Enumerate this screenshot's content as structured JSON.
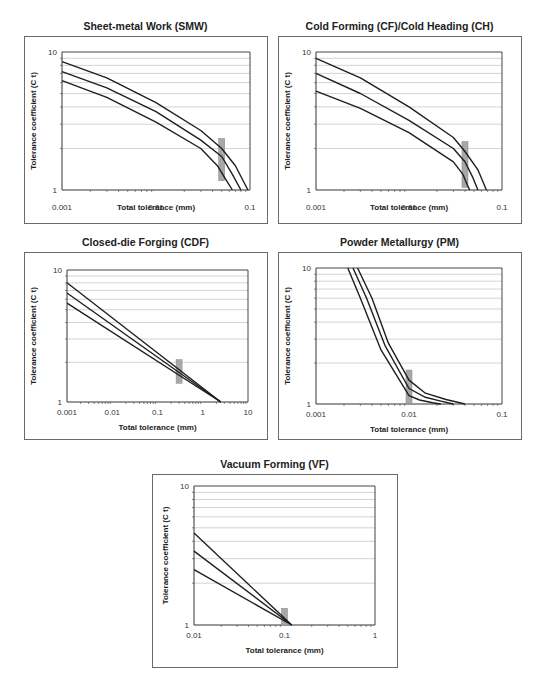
{
  "chart_data": [
    {
      "id": "smw",
      "type": "line",
      "title": "Sheet-metal Work (SMW)",
      "xlabel": "Total tolerance (mm)",
      "ylabel": "Tolerance coefficient (C t)",
      "xscale": "log",
      "yscale": "log",
      "xlim": [
        0.001,
        0.1
      ],
      "ylim": [
        1,
        10
      ],
      "xticks": [
        "0.001",
        "0.01",
        "0.1"
      ],
      "yticks": [
        "1",
        "10"
      ],
      "grid": "horizontal minor gridlines",
      "legend": null,
      "marker_band_x": 0.05,
      "series": [
        {
          "name": "upper",
          "x": [
            0.001,
            0.003,
            0.01,
            0.03,
            0.05,
            0.07,
            0.095
          ],
          "y": [
            8.5,
            6.5,
            4.3,
            2.7,
            2.0,
            1.5,
            1.0
          ]
        },
        {
          "name": "middle",
          "x": [
            0.001,
            0.003,
            0.01,
            0.03,
            0.05,
            0.065,
            0.08
          ],
          "y": [
            7.2,
            5.5,
            3.7,
            2.3,
            1.75,
            1.3,
            1.0
          ]
        },
        {
          "name": "lower",
          "x": [
            0.001,
            0.003,
            0.01,
            0.03,
            0.045,
            0.055,
            0.065
          ],
          "y": [
            6.2,
            4.7,
            3.1,
            2.0,
            1.5,
            1.2,
            1.0
          ]
        }
      ]
    },
    {
      "id": "cfch",
      "type": "line",
      "title": "Cold Forming (CF)/Cold Heading (CH)",
      "xlabel": "Total tolerance (mm)",
      "ylabel": "Tolerance coefficient (C t)",
      "xscale": "log",
      "yscale": "log",
      "xlim": [
        0.001,
        0.1
      ],
      "ylim": [
        1,
        10
      ],
      "xticks": [
        "0.001",
        "0.01",
        "0.1"
      ],
      "yticks": [
        "1",
        "10"
      ],
      "grid": "horizontal minor gridlines",
      "legend": null,
      "marker_band_x": 0.04,
      "series": [
        {
          "name": "upper",
          "x": [
            0.001,
            0.003,
            0.01,
            0.03,
            0.04,
            0.055,
            0.068
          ],
          "y": [
            9.0,
            6.5,
            4.0,
            2.4,
            1.9,
            1.4,
            1.0
          ]
        },
        {
          "name": "middle",
          "x": [
            0.001,
            0.003,
            0.01,
            0.03,
            0.04,
            0.048,
            0.055
          ],
          "y": [
            7.0,
            5.0,
            3.2,
            2.0,
            1.6,
            1.25,
            1.0
          ]
        },
        {
          "name": "lower",
          "x": [
            0.001,
            0.003,
            0.01,
            0.03,
            0.038,
            0.042,
            0.045
          ],
          "y": [
            5.2,
            3.9,
            2.6,
            1.6,
            1.3,
            1.1,
            1.0
          ]
        }
      ]
    },
    {
      "id": "cdf",
      "type": "line",
      "title": "Closed-die Forging (CDF)",
      "xlabel": "Total tolerance (mm)",
      "ylabel": "Tolerance coefficient (C t)",
      "xscale": "log",
      "yscale": "log",
      "xlim": [
        0.001,
        10
      ],
      "ylim": [
        1,
        10
      ],
      "xticks": [
        "0.001",
        "0.01",
        "0.1",
        "1",
        "10"
      ],
      "yticks": [
        "1",
        "10"
      ],
      "grid": "horizontal minor gridlines",
      "legend": null,
      "marker_band_x": 0.3,
      "series": [
        {
          "name": "upper",
          "x": [
            0.001,
            2.5
          ],
          "y": [
            8.0,
            1.0
          ]
        },
        {
          "name": "middle",
          "x": [
            0.001,
            2.5
          ],
          "y": [
            6.7,
            1.0
          ]
        },
        {
          "name": "lower",
          "x": [
            0.001,
            2.5
          ],
          "y": [
            5.6,
            1.0
          ]
        }
      ]
    },
    {
      "id": "pm",
      "type": "line",
      "title": "Powder Metallurgy (PM)",
      "xlabel": "Total tolerance (mm)",
      "ylabel": "Tolerance coefficient (C t)",
      "xscale": "log",
      "yscale": "log",
      "xlim": [
        0.001,
        0.1
      ],
      "ylim": [
        1,
        10
      ],
      "xticks": [
        "0.001",
        "0.01",
        "0.1"
      ],
      "yticks": [
        "1",
        "10"
      ],
      "grid": "horizontal minor gridlines",
      "legend": null,
      "marker_band_x": 0.01,
      "series": [
        {
          "name": "upper",
          "x": [
            0.0028,
            0.004,
            0.006,
            0.01,
            0.015,
            0.025,
            0.04
          ],
          "y": [
            10,
            6.0,
            2.8,
            1.5,
            1.2,
            1.08,
            1.0
          ]
        },
        {
          "name": "middle",
          "x": [
            0.0025,
            0.0035,
            0.0055,
            0.01,
            0.015,
            0.022,
            0.03
          ],
          "y": [
            10,
            6.0,
            2.7,
            1.3,
            1.12,
            1.05,
            1.0
          ]
        },
        {
          "name": "lower",
          "x": [
            0.0022,
            0.003,
            0.005,
            0.01,
            0.013,
            0.018,
            0.022
          ],
          "y": [
            10,
            6.0,
            2.5,
            1.15,
            1.07,
            1.02,
            1.0
          ]
        }
      ]
    },
    {
      "id": "vf",
      "type": "line",
      "title": "Vacuum Forming (VF)",
      "xlabel": "Total tolerance (mm)",
      "ylabel": "Tolerance coefficient (C t)",
      "xscale": "log",
      "yscale": "log",
      "xlim": [
        0.01,
        1
      ],
      "ylim": [
        1,
        10
      ],
      "xticks": [
        "0.01",
        "0.1",
        "1"
      ],
      "yticks": [
        "1",
        "10"
      ],
      "grid": "horizontal minor gridlines",
      "legend": null,
      "marker_band_x": 0.1,
      "series": [
        {
          "name": "upper",
          "x": [
            0.01,
            0.12
          ],
          "y": [
            4.6,
            1.0
          ]
        },
        {
          "name": "middle",
          "x": [
            0.01,
            0.12
          ],
          "y": [
            3.4,
            1.0
          ]
        },
        {
          "name": "lower",
          "x": [
            0.01,
            0.12
          ],
          "y": [
            2.5,
            1.0
          ]
        }
      ]
    }
  ],
  "panels": {
    "smw": {
      "title": "Sheet-metal Work (SMW)",
      "xlabel": "Total tolerance (mm)",
      "ylabel": "Tolerance coefficient (C t)"
    },
    "cfch": {
      "title": "Cold Forming (CF)/Cold Heading (CH)",
      "xlabel": "Total tolerance (mm)",
      "ylabel": "Tolerance coefficient (C t)"
    },
    "cdf": {
      "title": "Closed-die Forging (CDF)",
      "xlabel": "Total tolerance (mm)",
      "ylabel": "Tolerance coefficient (C t)"
    },
    "pm": {
      "title": "Powder Metallurgy (PM)",
      "xlabel": "Total tolerance (mm)",
      "ylabel": "Tolerance coefficient (C t)"
    },
    "vf": {
      "title": "Vacuum Forming (VF)",
      "xlabel": "Total tolerance (mm)",
      "ylabel": "Tolerance coefficient (C t)"
    }
  },
  "colors": {
    "line": "#1e1e1e",
    "grid": "#c8c8c8",
    "frame": "#6a6a6a",
    "marker": "#a8a8a8"
  }
}
